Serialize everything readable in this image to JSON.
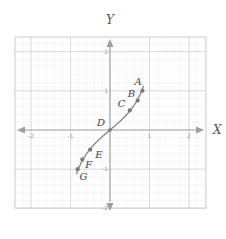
{
  "diagram": {
    "type": "coordinate-plane-curve",
    "axes": {
      "x_label": "X",
      "y_label": "Y",
      "x_range": [
        -2.2,
        2.2
      ],
      "y_range": [
        -2.2,
        2.2
      ],
      "x_ticks": [
        {
          "value": -2,
          "label": "-2"
        },
        {
          "value": -1,
          "label": "-1"
        },
        {
          "value": 1,
          "label": "1"
        },
        {
          "value": 2,
          "label": "2"
        }
      ],
      "y_ticks": [
        {
          "value": 2,
          "label": "2"
        },
        {
          "value": 1,
          "label": "1"
        },
        {
          "value": -1,
          "label": "-1"
        },
        {
          "value": -2,
          "label": "-2"
        }
      ],
      "grid_minor_step": 0.2,
      "grid_major_step": 1
    },
    "curve": {
      "description": "odd, increasing S-shaped curve through origin",
      "color": "#8a8a8a",
      "x_extent": [
        -0.85,
        0.85
      ]
    },
    "points": [
      {
        "label": "A",
        "x": 0.82,
        "y": 1.0
      },
      {
        "label": "B",
        "x": 0.7,
        "y": 0.75
      },
      {
        "label": "C",
        "x": 0.5,
        "y": 0.5
      },
      {
        "label": "D",
        "x": 0.0,
        "y": 0.0
      },
      {
        "label": "E",
        "x": -0.5,
        "y": -0.5
      },
      {
        "label": "F",
        "x": -0.7,
        "y": -0.75
      },
      {
        "label": "G",
        "x": -0.82,
        "y": -1.0
      }
    ],
    "colors": {
      "axis": "#9e9e9e",
      "grid_major": "#d9d9d9",
      "grid_minor": "#eeeeee",
      "frame": "#cfcfcf",
      "point": "#7a7a7a"
    }
  }
}
